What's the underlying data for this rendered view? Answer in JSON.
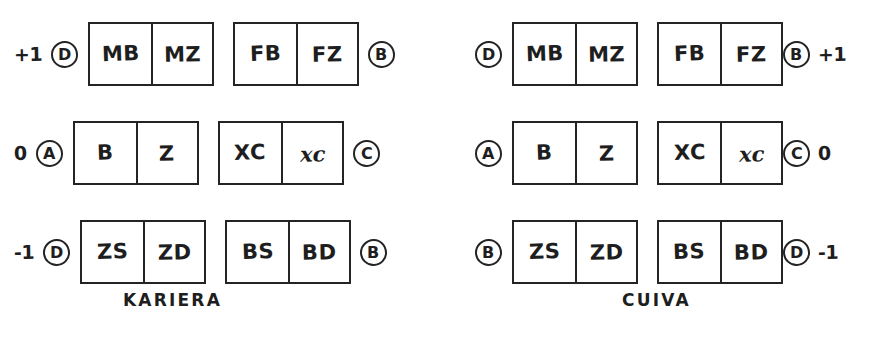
{
  "figure": {
    "background_color": "#ffffff",
    "ink_color": "#242424",
    "style": "hand-drawn kinship section diagram"
  },
  "diagrams": [
    {
      "id": "kariera",
      "caption": "KARIERA",
      "marker_layout": "number-then-circle on left, circle on right",
      "rows": [
        {
          "generation": "+1",
          "left_circle": "D",
          "right_circle": "B",
          "boxes": [
            {
              "cells": [
                {
                  "text": "MB",
                  "style": "upright"
                },
                {
                  "text": "MZ",
                  "style": "upright"
                }
              ]
            },
            {
              "cells": [
                {
                  "text": "FB",
                  "style": "upright"
                },
                {
                  "text": "FZ",
                  "style": "upright"
                }
              ]
            }
          ]
        },
        {
          "generation": "0",
          "left_circle": "A",
          "right_circle": "C",
          "boxes": [
            {
              "cells": [
                {
                  "text": "B",
                  "style": "upright"
                },
                {
                  "text": "Z",
                  "style": "upright"
                }
              ]
            },
            {
              "cells": [
                {
                  "text": "XC",
                  "style": "upright"
                },
                {
                  "text": "xc",
                  "style": "italic"
                }
              ]
            }
          ]
        },
        {
          "generation": "-1",
          "left_circle": "D",
          "right_circle": "B",
          "boxes": [
            {
              "cells": [
                {
                  "text": "ZS",
                  "style": "upright"
                },
                {
                  "text": "ZD",
                  "style": "upright"
                }
              ]
            },
            {
              "cells": [
                {
                  "text": "BS",
                  "style": "upright"
                },
                {
                  "text": "BD",
                  "style": "upright"
                }
              ]
            }
          ]
        }
      ]
    },
    {
      "id": "cuiva",
      "caption": "CUIVA",
      "marker_layout": "circle on left, circle-then-number on right",
      "rows": [
        {
          "generation": "+1",
          "left_circle": "D",
          "right_circle": "B",
          "boxes": [
            {
              "cells": [
                {
                  "text": "MB",
                  "style": "upright"
                },
                {
                  "text": "MZ",
                  "style": "upright"
                }
              ]
            },
            {
              "cells": [
                {
                  "text": "FB",
                  "style": "upright"
                },
                {
                  "text": "FZ",
                  "style": "upright"
                }
              ]
            }
          ]
        },
        {
          "generation": "0",
          "left_circle": "A",
          "right_circle": "C",
          "boxes": [
            {
              "cells": [
                {
                  "text": "B",
                  "style": "upright"
                },
                {
                  "text": "Z",
                  "style": "upright"
                }
              ]
            },
            {
              "cells": [
                {
                  "text": "XC",
                  "style": "upright"
                },
                {
                  "text": "xc",
                  "style": "italic"
                }
              ]
            }
          ]
        },
        {
          "generation": "-1",
          "left_circle": "B",
          "right_circle": "D",
          "boxes": [
            {
              "cells": [
                {
                  "text": "ZS",
                  "style": "upright"
                },
                {
                  "text": "ZD",
                  "style": "upright"
                }
              ]
            },
            {
              "cells": [
                {
                  "text": "BS",
                  "style": "upright"
                },
                {
                  "text": "BD",
                  "style": "upright"
                }
              ]
            }
          ]
        }
      ]
    }
  ]
}
